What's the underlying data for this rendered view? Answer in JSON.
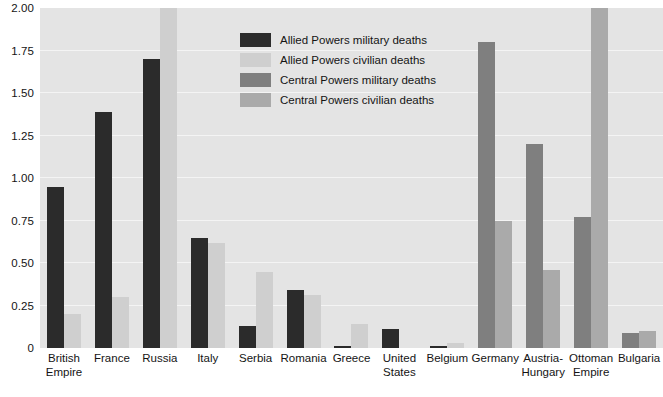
{
  "chart_data": {
    "type": "bar",
    "title": "",
    "xlabel": "",
    "ylabel": "",
    "ylim": [
      0,
      2.0
    ],
    "yticks": [
      "0",
      "0.25",
      "0.50",
      "0.75",
      "1.00",
      "1.25",
      "1.50",
      "1.75",
      "2.00"
    ],
    "ytick_values": [
      0,
      0.25,
      0.5,
      0.75,
      1.0,
      1.25,
      1.5,
      1.75,
      2.0
    ],
    "grid": true,
    "legend_position": "upper center",
    "categories": [
      "British Empire",
      "France",
      "Russia",
      "Italy",
      "Serbia",
      "Romania",
      "Greece",
      "United States",
      "Belgium",
      "Germany",
      "Austria-Hungary",
      "Ottoman Empire",
      "Bulgaria"
    ],
    "category_labels": [
      "British\nEmpire",
      "France",
      "Russia",
      "Italy",
      "Serbia",
      "Romania",
      "Greece",
      "United\nStates",
      "Belgium",
      "Germany",
      "Austria-\nHungary",
      "Ottoman\nEmpire",
      "Bulgaria"
    ],
    "series": [
      {
        "name": "Allied Powers military deaths",
        "color": "#2b2b2b",
        "values": [
          0.95,
          1.39,
          1.7,
          0.65,
          0.13,
          0.34,
          0.01,
          0.11,
          0.014,
          null,
          null,
          null,
          null
        ]
      },
      {
        "name": "Allied Powers civilian deaths",
        "color": "#cfcfcf",
        "values": [
          0.2,
          0.3,
          2.0,
          0.62,
          0.45,
          0.31,
          0.14,
          0.0,
          0.03,
          null,
          null,
          null,
          null
        ]
      },
      {
        "name": "Central Powers military deaths",
        "color": "#7f7f7f",
        "values": [
          null,
          null,
          null,
          null,
          null,
          null,
          null,
          null,
          null,
          1.8,
          1.2,
          0.77,
          0.09
        ]
      },
      {
        "name": "Central Powers civilian deaths",
        "color": "#aaaaaa",
        "values": [
          null,
          null,
          null,
          null,
          null,
          null,
          null,
          null,
          null,
          0.75,
          0.46,
          2.0,
          0.1
        ]
      }
    ]
  },
  "legend": {
    "items": [
      {
        "label": "Allied Powers military deaths",
        "color": "#2b2b2b"
      },
      {
        "label": "Allied Powers civilian deaths",
        "color": "#cfcfcf"
      },
      {
        "label": "Central Powers military deaths",
        "color": "#7f7f7f"
      },
      {
        "label": "Central Powers civilian deaths",
        "color": "#aaaaaa"
      }
    ]
  }
}
